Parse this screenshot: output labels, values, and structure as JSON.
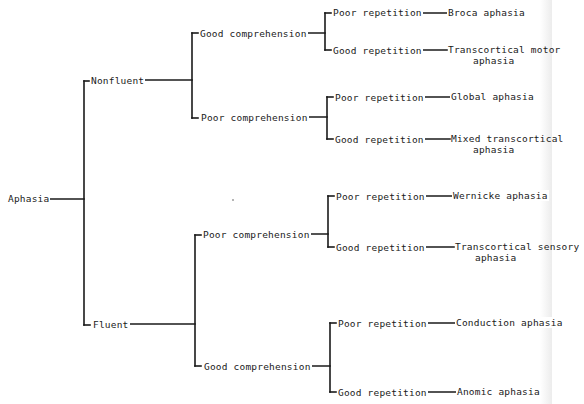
{
  "diagram": {
    "root": "Aphasia",
    "level1": {
      "nonfluent": "Nonfluent",
      "fluent": "Fluent"
    },
    "nonfluent": {
      "good_comprehension": {
        "label": "Good comprehension",
        "poor_repetition": {
          "label": "Poor repetition",
          "result": "Broca aphasia"
        },
        "good_repetition": {
          "label": "Good repetition",
          "result_line1": "Transcortical motor",
          "result_line2": "aphasia"
        }
      },
      "poor_comprehension": {
        "label": "Poor comprehension",
        "poor_repetition": {
          "label": "Poor repetition",
          "result": "Global aphasia"
        },
        "good_repetition": {
          "label": "Good repetition",
          "result_line1": "Mixed transcortical",
          "result_line2": "aphasia"
        }
      }
    },
    "fluent": {
      "poor_comprehension": {
        "label": "Poor comprehension",
        "poor_repetition": {
          "label": "Poor repetition",
          "result": "Wernicke aphasia"
        },
        "good_repetition": {
          "label": "Good repetition",
          "result_line1": "Transcortical sensory",
          "result_line2": "aphasia"
        }
      },
      "good_comprehension": {
        "label": "Good comprehension",
        "poor_repetition": {
          "label": "Poor repetition",
          "result": "Conduction aphasia"
        },
        "good_repetition": {
          "label": "Good repetition",
          "result": "Anomic aphasia"
        }
      }
    },
    "line_color": "#1a1a1a"
  }
}
